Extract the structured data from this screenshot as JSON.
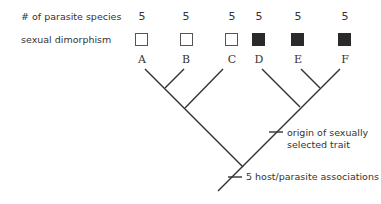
{
  "row_labels": {
    "species_count": "# of parasite species",
    "dimorphism": "sexual dimorphism"
  },
  "taxa": [
    {
      "name": "A",
      "species": "5",
      "dimorphic": false
    },
    {
      "name": "B",
      "species": "5",
      "dimorphic": false
    },
    {
      "name": "C",
      "species": "5",
      "dimorphic": false
    },
    {
      "name": "D",
      "species": "5",
      "dimorphic": true
    },
    {
      "name": "E",
      "species": "5",
      "dimorphic": true
    },
    {
      "name": "F",
      "species": "5",
      "dimorphic": true
    }
  ],
  "annotations": {
    "origin_line1": "origin of sexually",
    "origin_line2": "selected trait",
    "host": "5 host/parasite associations"
  },
  "colors": {
    "line": "#333333",
    "filled_box": "#2a2a2a"
  }
}
